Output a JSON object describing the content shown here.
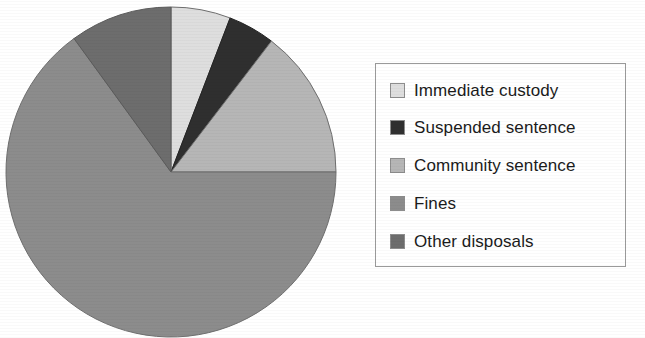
{
  "chart_data": {
    "type": "pie",
    "title": "",
    "subtitle": "",
    "xlabel": "",
    "ylabel": "",
    "grid": false,
    "legend_position": "right",
    "start_angle_deg": 0,
    "direction": "clockwise",
    "categories": [
      "Immediate custody",
      "Suspended sentence",
      "Community sentence",
      "Fines",
      "Other disposals"
    ],
    "values": [
      5.8,
      4.6,
      14.6,
      65.0,
      10.0
    ],
    "units": "percent",
    "slices": [
      {
        "label": "Immediate custody",
        "value": 5.8,
        "start_deg": 0,
        "end_deg": 21,
        "color": "#dedede",
        "edge_color": "#6f6f6f"
      },
      {
        "label": "Suspended sentence",
        "value": 4.6,
        "start_deg": 21,
        "end_deg": 37.5,
        "color": "#2f2f2f",
        "edge_color": "#222222"
      },
      {
        "label": "Community sentence",
        "value": 14.6,
        "start_deg": 37.5,
        "end_deg": 90,
        "color": "#b6b6b6",
        "edge_color": "#6f6f6f"
      },
      {
        "label": "Fines",
        "value": 65.0,
        "start_deg": 90,
        "end_deg": 324,
        "color": "#8c8c8c",
        "edge_color": "#6f6f6f"
      },
      {
        "label": "Other disposals",
        "value": 10.0,
        "start_deg": 324,
        "end_deg": 360,
        "color": "#6d6d6d",
        "edge_color": "#5a5a5a"
      }
    ],
    "geometry": {
      "center_x": 167,
      "center_y": 167,
      "radius": 165
    }
  },
  "legend": {
    "items": [
      {
        "label": "Immediate custody",
        "color": "#dedede"
      },
      {
        "label": "Suspended sentence",
        "color": "#2f2f2f"
      },
      {
        "label": "Community sentence",
        "color": "#b6b6b6"
      },
      {
        "label": "Fines",
        "color": "#8c8c8c"
      },
      {
        "label": "Other disposals",
        "color": "#6d6d6d"
      }
    ]
  }
}
